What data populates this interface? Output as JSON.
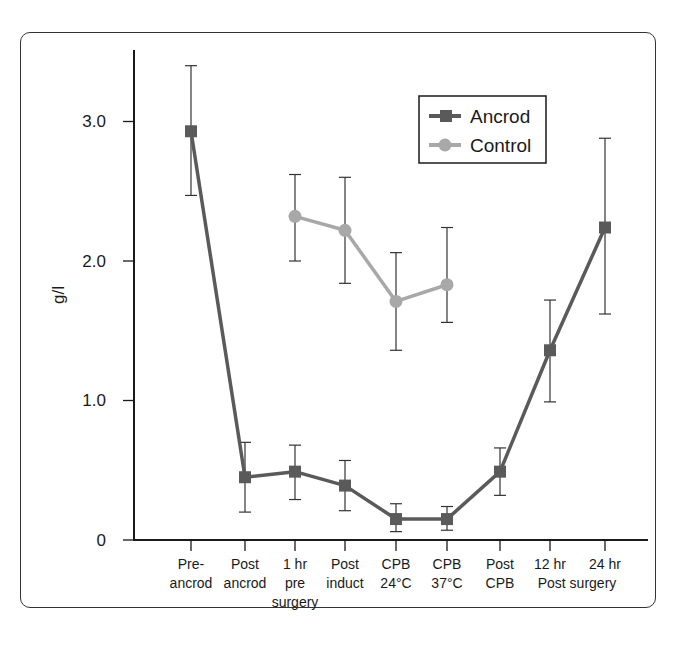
{
  "chart_data": {
    "type": "line",
    "title": "",
    "xlabel": "",
    "ylabel": "g/l",
    "ylim": [
      0,
      3.5
    ],
    "yticks": [
      0,
      1.0,
      2.0,
      3.0
    ],
    "ytick_labels": [
      "0",
      "1.0",
      "2.0",
      "3.0"
    ],
    "grid": false,
    "legend_position": "upper right (inside)",
    "categories": [
      [
        "Pre-",
        "ancrod"
      ],
      [
        "Post",
        "ancrod"
      ],
      [
        "1 hr",
        "pre",
        "surgery"
      ],
      [
        "Post",
        "induct"
      ],
      [
        "CPB",
        "24°C"
      ],
      [
        "CPB",
        "37°C"
      ],
      [
        "Post",
        "CPB"
      ],
      [
        "12 hr",
        "Post surgery"
      ],
      [
        "24 hr",
        ""
      ]
    ],
    "series": [
      {
        "name": "Ancrod",
        "marker": "square",
        "color": "#5a5a5a",
        "values": [
          2.93,
          0.45,
          0.49,
          0.39,
          0.15,
          0.15,
          0.49,
          1.36,
          2.24
        ],
        "err_upper": [
          3.4,
          0.7,
          0.68,
          0.57,
          0.26,
          0.24,
          0.66,
          1.72,
          2.88
        ],
        "err_lower": [
          2.47,
          0.2,
          0.29,
          0.21,
          0.06,
          0.07,
          0.32,
          0.99,
          1.62
        ]
      },
      {
        "name": "Control",
        "marker": "circle",
        "color": "#a8a8a8",
        "values": [
          null,
          null,
          2.32,
          2.22,
          1.71,
          1.83,
          null,
          null,
          null
        ],
        "err_upper": [
          null,
          null,
          2.62,
          2.6,
          2.06,
          2.24,
          null,
          null,
          null
        ],
        "err_lower": [
          null,
          null,
          2.0,
          1.84,
          1.36,
          1.56,
          null,
          null,
          null
        ]
      }
    ]
  },
  "axis": {
    "y_label": "g/l",
    "y_ticks": [
      "0",
      "1.0",
      "2.0",
      "3.0"
    ]
  },
  "x_labels": [
    {
      "line1": "Pre-",
      "line2": "ancrod",
      "line3": ""
    },
    {
      "line1": "Post",
      "line2": "ancrod",
      "line3": ""
    },
    {
      "line1": "1 hr",
      "line2": "pre",
      "line3": "surgery"
    },
    {
      "line1": "Post",
      "line2": "induct",
      "line3": ""
    },
    {
      "line1": "CPB",
      "line2": "24°C",
      "line3": ""
    },
    {
      "line1": "CPB",
      "line2": "37°C",
      "line3": ""
    },
    {
      "line1": "Post",
      "line2": "CPB",
      "line3": ""
    },
    {
      "line1": "12 hr",
      "line2": "",
      "line3": ""
    },
    {
      "line1": "24 hr",
      "line2": "",
      "line3": ""
    }
  ],
  "x_shared_label": "Post surgery",
  "legend": {
    "items": [
      {
        "label": "Ancrod",
        "color": "#5a5a5a",
        "marker": "square"
      },
      {
        "label": "Control",
        "color": "#a8a8a8",
        "marker": "circle"
      }
    ]
  },
  "colors": {
    "ancrod": "#5a5a5a",
    "control": "#a8a8a8",
    "axis": "#1a1a1a"
  }
}
